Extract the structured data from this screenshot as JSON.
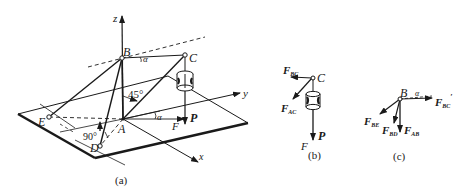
{
  "figure_a": {
    "caption": "(a)",
    "points": {
      "A": "A",
      "B": "B",
      "C": "C",
      "D": "D",
      "E": "E"
    },
    "axes": {
      "x": "x",
      "y": "y",
      "z": "z"
    },
    "angles": {
      "bc_angle": "α",
      "f_angle": "α",
      "vertical_angle": "45°",
      "right_angle": "90°"
    },
    "forces": {
      "P": "P",
      "F": "F"
    }
  },
  "figure_b": {
    "caption": "(b)",
    "point": "C",
    "forces": {
      "F_BC_main": "F",
      "F_BC_sub": "BC",
      "F_AC_main": "F",
      "F_AC_sub": "AC",
      "P": "P",
      "F_label": "F"
    }
  },
  "figure_c": {
    "caption": "(c)",
    "point": "B",
    "angle": "α",
    "forces": {
      "F_BC_main": "F",
      "F_BC_sub": "BC",
      "F_BC_prime": "′",
      "F_BE_main": "F",
      "F_BE_sub": "BE",
      "F_BD_main": "F",
      "F_BD_sub": "BD",
      "F_AB_main": "F",
      "F_AB_sub": "AB"
    }
  }
}
